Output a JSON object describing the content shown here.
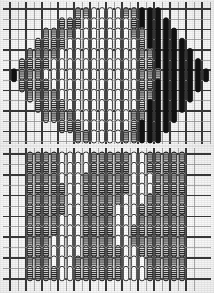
{
  "figure": {
    "background_color": "#fdfdfd",
    "grid_color": "#3a3a3a",
    "grid_minor_color": "#8d8d8d",
    "ink_color": "#141414",
    "panel_count": 2
  },
  "legend": {
    "fill_types": [
      {
        "key": "hatched",
        "label": "hatched",
        "color": "#7b7b7b"
      },
      {
        "key": "white",
        "label": "open",
        "color": "#ffffff"
      },
      {
        "key": "black",
        "label": "filled",
        "color": "#111111"
      },
      {
        "key": "gray",
        "label": "gray",
        "color": "#a8a8a8"
      }
    ]
  },
  "panel_top": {
    "name": "lens-shaped cluster",
    "shape": "ellipse",
    "cols": 25,
    "rows": 13,
    "cell_w": 8.0,
    "cell_h": 10.2,
    "origin_x": 10,
    "origin_y": 9,
    "grid": {
      "major_every_x": 2,
      "major_every_y": 2,
      "major_width": 1.6,
      "minor_width": 0.7,
      "x_lines": 26,
      "y_lines": 14
    },
    "capsule": {
      "w": 5.2,
      "h": 13.0,
      "rx": 2.6
    },
    "chart_data": {
      "type": "heatmap",
      "title": "Panel A - lens-shaped occupancy",
      "xlabel": "",
      "ylabel": "",
      "categories": [],
      "legend_position": "none",
      "grid": true,
      "xlim": [
        0,
        25
      ],
      "ylim": [
        0,
        13
      ],
      "cells": [
        [
          0,
          0,
          0,
          0,
          0,
          0,
          0,
          0,
          1,
          1,
          2,
          2,
          2,
          2,
          1,
          1,
          3,
          3,
          3,
          0,
          0,
          0,
          0,
          0,
          0
        ],
        [
          0,
          0,
          0,
          0,
          0,
          0,
          1,
          1,
          1,
          2,
          2,
          2,
          2,
          2,
          2,
          1,
          3,
          3,
          3,
          3,
          0,
          0,
          0,
          0,
          0
        ],
        [
          0,
          0,
          0,
          0,
          1,
          1,
          1,
          1,
          2,
          2,
          2,
          2,
          2,
          2,
          2,
          1,
          1,
          3,
          3,
          3,
          3,
          0,
          0,
          0,
          0
        ],
        [
          0,
          0,
          0,
          1,
          1,
          1,
          1,
          2,
          2,
          2,
          2,
          2,
          2,
          2,
          2,
          2,
          1,
          3,
          3,
          3,
          3,
          3,
          0,
          0,
          0
        ],
        [
          0,
          0,
          1,
          1,
          1,
          1,
          2,
          2,
          2,
          2,
          2,
          2,
          2,
          2,
          2,
          2,
          1,
          1,
          3,
          3,
          3,
          3,
          3,
          0,
          0
        ],
        [
          0,
          1,
          1,
          1,
          1,
          2,
          2,
          2,
          2,
          2,
          2,
          2,
          2,
          2,
          2,
          2,
          1,
          1,
          3,
          3,
          3,
          3,
          3,
          3,
          0
        ],
        [
          3,
          1,
          1,
          1,
          2,
          2,
          2,
          2,
          2,
          2,
          2,
          2,
          2,
          2,
          2,
          2,
          1,
          1,
          1,
          3,
          3,
          3,
          3,
          3,
          3
        ],
        [
          0,
          1,
          1,
          1,
          1,
          2,
          2,
          2,
          2,
          2,
          2,
          2,
          2,
          2,
          2,
          2,
          1,
          1,
          3,
          3,
          3,
          3,
          3,
          3,
          0
        ],
        [
          0,
          0,
          1,
          1,
          1,
          1,
          2,
          2,
          2,
          2,
          2,
          2,
          2,
          2,
          2,
          2,
          1,
          1,
          3,
          3,
          3,
          3,
          3,
          0,
          0
        ],
        [
          0,
          0,
          0,
          1,
          1,
          1,
          1,
          2,
          2,
          2,
          2,
          2,
          2,
          2,
          2,
          2,
          1,
          3,
          3,
          3,
          3,
          3,
          0,
          0,
          0
        ],
        [
          0,
          0,
          0,
          0,
          1,
          1,
          1,
          1,
          2,
          2,
          2,
          2,
          2,
          2,
          2,
          1,
          1,
          3,
          3,
          3,
          3,
          0,
          0,
          0,
          0
        ],
        [
          0,
          0,
          0,
          0,
          0,
          0,
          1,
          1,
          1,
          2,
          2,
          2,
          2,
          2,
          2,
          1,
          3,
          3,
          3,
          3,
          0,
          0,
          0,
          0,
          0
        ],
        [
          0,
          0,
          0,
          0,
          0,
          0,
          0,
          0,
          1,
          1,
          2,
          2,
          2,
          2,
          1,
          1,
          3,
          3,
          3,
          0,
          0,
          0,
          0,
          0,
          0
        ]
      ],
      "cell_legend": {
        "0": "empty",
        "1": "hatched",
        "2": "white",
        "3": "black"
      }
    }
  },
  "panel_bottom": {
    "name": "rectangular array",
    "shape": "rectangle",
    "cols": 23,
    "rows": 12,
    "cell_w": 8.0,
    "cell_h": 10.4,
    "origin_x": 10,
    "origin_y": 8,
    "grid": {
      "major_every_x": 2,
      "major_every_y": 2,
      "major_width": 1.6,
      "minor_width": 0.7,
      "x_lines": 24,
      "y_lines": 13
    },
    "capsule": {
      "w": 5.4,
      "h": 14.5,
      "rx": 2.7
    },
    "chart_data": {
      "type": "heatmap",
      "title": "Panel B - rectangular array occupancy",
      "xlabel": "",
      "ylabel": "",
      "categories": [],
      "legend_position": "none",
      "grid": true,
      "xlim": [
        0,
        23
      ],
      "ylim": [
        0,
        12
      ],
      "cells": [
        [
          0,
          0,
          1,
          1,
          1,
          1,
          2,
          2,
          2,
          2,
          1,
          1,
          1,
          1,
          1,
          2,
          2,
          1,
          1,
          1,
          1,
          1,
          0
        ],
        [
          0,
          0,
          1,
          1,
          1,
          1,
          2,
          2,
          2,
          2,
          1,
          1,
          1,
          1,
          1,
          2,
          2,
          1,
          1,
          1,
          1,
          1,
          0
        ],
        [
          0,
          0,
          1,
          1,
          1,
          1,
          2,
          2,
          2,
          1,
          1,
          1,
          1,
          1,
          1,
          2,
          2,
          2,
          1,
          1,
          1,
          1,
          0
        ],
        [
          0,
          0,
          1,
          1,
          1,
          1,
          1,
          2,
          2,
          1,
          1,
          1,
          1,
          1,
          1,
          2,
          2,
          2,
          1,
          1,
          1,
          1,
          0
        ],
        [
          0,
          0,
          1,
          1,
          1,
          1,
          1,
          2,
          2,
          1,
          1,
          1,
          1,
          1,
          2,
          2,
          2,
          1,
          1,
          1,
          1,
          1,
          0
        ],
        [
          0,
          0,
          1,
          1,
          1,
          1,
          1,
          2,
          2,
          1,
          1,
          1,
          1,
          2,
          2,
          2,
          1,
          1,
          1,
          1,
          1,
          1,
          0
        ],
        [
          0,
          0,
          1,
          1,
          1,
          1,
          2,
          2,
          2,
          1,
          1,
          1,
          1,
          2,
          2,
          2,
          1,
          1,
          1,
          1,
          1,
          1,
          0
        ],
        [
          0,
          0,
          1,
          1,
          1,
          1,
          2,
          2,
          2,
          1,
          1,
          1,
          1,
          2,
          2,
          1,
          1,
          1,
          1,
          1,
          1,
          1,
          0
        ],
        [
          0,
          0,
          1,
          1,
          1,
          2,
          2,
          2,
          2,
          1,
          1,
          1,
          1,
          2,
          2,
          1,
          1,
          1,
          1,
          1,
          1,
          1,
          0
        ],
        [
          0,
          0,
          1,
          1,
          1,
          2,
          2,
          2,
          2,
          1,
          1,
          1,
          1,
          1,
          2,
          2,
          1,
          1,
          1,
          1,
          1,
          1,
          0
        ],
        [
          0,
          0,
          1,
          1,
          1,
          2,
          2,
          2,
          1,
          1,
          1,
          1,
          1,
          1,
          2,
          2,
          2,
          1,
          1,
          1,
          1,
          1,
          0
        ],
        [
          0,
          0,
          1,
          1,
          1,
          1,
          2,
          2,
          1,
          1,
          1,
          1,
          1,
          1,
          2,
          2,
          2,
          1,
          1,
          1,
          1,
          1,
          0
        ]
      ],
      "cell_legend": {
        "0": "empty",
        "1": "hatched",
        "2": "white",
        "3": "black"
      }
    }
  }
}
